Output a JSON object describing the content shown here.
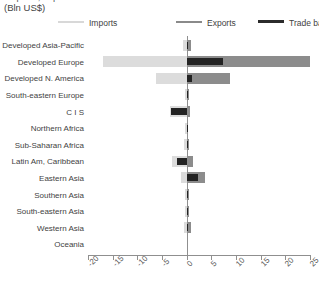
{
  "header": {
    "title_clipped": "Imports, exports and trade balance",
    "subtitle": "(Bln US$)"
  },
  "legend": {
    "position": "top",
    "items": [
      {
        "label": "Imports",
        "color": "#dcdcdc",
        "icon": "line-swatch-icon"
      },
      {
        "label": "Exports",
        "color": "#8c8c8c",
        "icon": "line-swatch-icon"
      },
      {
        "label": "Trade balance",
        "color": "#232323",
        "icon": "line-swatch-icon"
      }
    ]
  },
  "chart_data": {
    "type": "bar",
    "orientation": "horizontal",
    "title": "Imports, exports and trade balance",
    "subtitle": "(Bln US$)",
    "xlabel": "",
    "ylabel": "",
    "xlim": [
      -20,
      25
    ],
    "xticks": [
      -20,
      -15,
      -10,
      -5,
      0,
      5,
      10,
      15,
      20,
      25
    ],
    "xtick_labels": [
      "-20",
      "-15",
      "-10",
      "-5",
      "0",
      "5",
      "10",
      "15",
      "20",
      "25"
    ],
    "grid": false,
    "legend_position": "top",
    "categories": [
      "Developed Asia-Pacific",
      "Developed Europe",
      "Developed N. America",
      "South-eastern Europe",
      "C I S",
      "Northern Africa",
      "Sub-Saharan Africa",
      "Latin Am, Caribbean",
      "Eastern Asia",
      "Southern Asia",
      "South-eastern Asia",
      "Western Asia",
      "Oceania"
    ],
    "series": [
      {
        "name": "Imports",
        "color": "#dcdcdc",
        "values": [
          -0.8,
          -17.0,
          -6.2,
          -0.4,
          -3.3,
          -0.2,
          -0.5,
          -3.0,
          -1.1,
          -0.3,
          -0.4,
          -0.6,
          0.0
        ]
      },
      {
        "name": "Exports",
        "color": "#8c8c8c",
        "values": [
          0.9,
          25.0,
          8.8,
          0.5,
          0.6,
          0.3,
          0.4,
          1.2,
          3.7,
          0.4,
          0.4,
          0.8,
          0.0
        ]
      },
      {
        "name": "Trade balance",
        "color": "#232323",
        "values": [
          0.3,
          7.3,
          1.0,
          0.2,
          -3.1,
          0.1,
          0.2,
          -2.0,
          2.4,
          0.2,
          0.2,
          0.3,
          0.0
        ]
      }
    ]
  }
}
